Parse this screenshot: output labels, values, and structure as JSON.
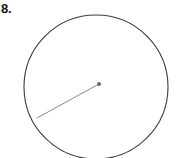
{
  "figure": {
    "problem_number": "8.",
    "background_color": "#ffffff",
    "width": 176,
    "height": 158,
    "shapes": {
      "circle": {
        "name": "circle-outline",
        "center_x": 96,
        "center_y": 87,
        "radius": 72,
        "stroke_color": "#3a3a3a",
        "stroke_width": 1.1,
        "fill": "none"
      },
      "center_point": {
        "name": "center-point-dot",
        "cx": 99,
        "cy": 84,
        "r": 2,
        "fill_color": "#6b6b6b"
      },
      "radius_segment": {
        "name": "radius-line",
        "x1": 99,
        "y1": 84,
        "x2": 37,
        "y2": 118,
        "stroke_color": "#8a8a8a",
        "stroke_width": 1
      }
    },
    "label_color": "#141414"
  }
}
